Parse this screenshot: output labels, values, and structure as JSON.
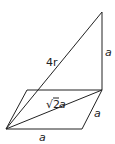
{
  "diagram": {
    "type": "geometry",
    "labels": {
      "vertical_edge": "a",
      "space_diagonal": "4r",
      "base_diagonal_radical": "√",
      "base_diagonal_num": "2",
      "base_diagonal_var": "a",
      "right_edge": "a",
      "bottom_edge": "a"
    },
    "points": {
      "apex": [
        102,
        12
      ],
      "top_right": [
        102,
        90
      ],
      "top_left": [
        27,
        90
      ],
      "bottom_left": [
        6,
        129
      ],
      "bottom_right": [
        82,
        129
      ]
    },
    "stroke_color": "#222222"
  }
}
